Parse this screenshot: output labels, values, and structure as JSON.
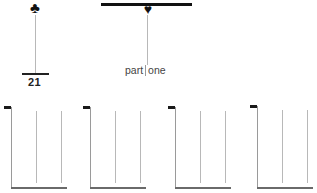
{
  "top_left": {
    "suit_icon": "club-icon",
    "suit_glyph": "♣",
    "number_label": "21"
  },
  "top_center": {
    "suit_icon": "heart-icon",
    "suit_glyph": "♥",
    "label_left": "part",
    "label_right": "one"
  },
  "brackets": [
    {
      "id": 1
    },
    {
      "id": 2
    },
    {
      "id": 3
    },
    {
      "id": 4
    }
  ],
  "colors": {
    "ink": "#111111",
    "stem": "#b8b8b8",
    "baseline": "#6a6a6a"
  }
}
